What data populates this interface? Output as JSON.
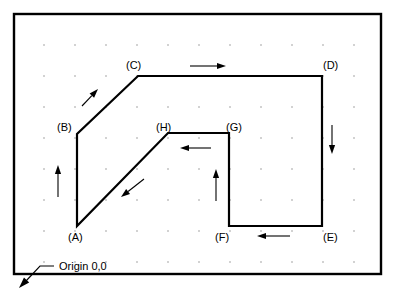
{
  "figure": {
    "frame": {
      "x": 14,
      "y": 14,
      "width": 367,
      "height": 260,
      "stroke_color": "#000000"
    },
    "background_color": "#ffffff",
    "line_color": "#000000",
    "grid_dot_color": "#9a9a9a"
  },
  "chart_data": {
    "type": "line",
    "xlabel": "",
    "ylabel": "",
    "grid": "dot-grid",
    "legend": "none",
    "closed_path": true,
    "vertex_order": [
      "A",
      "B",
      "C",
      "D",
      "E",
      "F",
      "G",
      "H"
    ],
    "points": [
      {
        "name": "A",
        "x": 77,
        "y": 226,
        "label": "(A)"
      },
      {
        "name": "B",
        "x": 77,
        "y": 134,
        "label": "(B)"
      },
      {
        "name": "C",
        "x": 138,
        "y": 76,
        "label": "(C)"
      },
      {
        "name": "D",
        "x": 322,
        "y": 76,
        "label": "(D)"
      },
      {
        "name": "E",
        "x": 322,
        "y": 226,
        "label": "(E)"
      },
      {
        "name": "F",
        "x": 229,
        "y": 226,
        "label": "(F)"
      },
      {
        "name": "G",
        "x": 229,
        "y": 133,
        "label": "(G)"
      },
      {
        "name": "H",
        "x": 168,
        "y": 133,
        "label": "(H)"
      }
    ],
    "segments": [
      {
        "from": "A",
        "to": "B",
        "direction": "up"
      },
      {
        "from": "B",
        "to": "C",
        "direction": "up-right"
      },
      {
        "from": "C",
        "to": "D",
        "direction": "right"
      },
      {
        "from": "D",
        "to": "E",
        "direction": "down"
      },
      {
        "from": "E",
        "to": "F",
        "direction": "left"
      },
      {
        "from": "F",
        "to": "G",
        "direction": "up"
      },
      {
        "from": "G",
        "to": "H",
        "direction": "left"
      },
      {
        "from": "H",
        "to": "A",
        "direction": "down-left"
      }
    ]
  },
  "vertex_labels": [
    {
      "text": "(A)",
      "x": 68,
      "y": 241
    },
    {
      "text": "(B)",
      "x": 57,
      "y": 131
    },
    {
      "text": "(C)",
      "x": 126,
      "y": 69
    },
    {
      "text": "(D)",
      "x": 323,
      "y": 69
    },
    {
      "text": "(E)",
      "x": 323,
      "y": 241
    },
    {
      "text": "(F)",
      "x": 215,
      "y": 241
    },
    {
      "text": "(G)",
      "x": 226,
      "y": 131
    },
    {
      "text": "(H)",
      "x": 156,
      "y": 131
    }
  ],
  "annotations": [
    {
      "name": "origin-callout",
      "text": "Origin 0,0",
      "text_x": 59,
      "text_y": 270,
      "leader_from_x": 54,
      "leader_from_y": 266,
      "leader_mid_x": 40,
      "leader_mid_y": 266,
      "leader_to_x": 19,
      "leader_to_y": 288
    }
  ],
  "direction_arrows": [
    {
      "name": "arrow-segment-ab-up",
      "x1": 58,
      "y1": 197,
      "x2": 58,
      "y2": 165,
      "segment": "A-B"
    },
    {
      "name": "arrow-segment-bc-up-right",
      "x1": 82,
      "y1": 106,
      "x2": 98,
      "y2": 89,
      "segment": "B-C"
    },
    {
      "name": "arrow-segment-cd-right",
      "x1": 190,
      "y1": 66,
      "x2": 226,
      "y2": 66,
      "segment": "C-D"
    },
    {
      "name": "arrow-segment-de-down",
      "x1": 332,
      "y1": 125,
      "x2": 332,
      "y2": 154,
      "segment": "D-E"
    },
    {
      "name": "arrow-segment-ef-left",
      "x1": 290,
      "y1": 236,
      "x2": 257,
      "y2": 236,
      "segment": "E-F"
    },
    {
      "name": "arrow-segment-fg-up",
      "x1": 216,
      "y1": 201,
      "x2": 216,
      "y2": 169,
      "segment": "F-G"
    },
    {
      "name": "arrow-segment-gh-left",
      "x1": 211,
      "y1": 148,
      "x2": 180,
      "y2": 148,
      "segment": "G-H"
    },
    {
      "name": "arrow-segment-ha-down-left",
      "x1": 144,
      "y1": 179,
      "x2": 121,
      "y2": 197,
      "segment": "H-A"
    }
  ],
  "grid": {
    "origin_x": 44,
    "origin_y": 45,
    "spacing_x": 31,
    "spacing_y": 31,
    "cols": 11,
    "rows": 8,
    "dot_radius": 0.8
  }
}
